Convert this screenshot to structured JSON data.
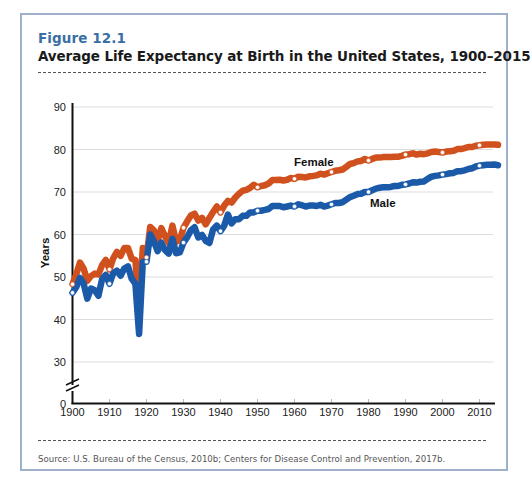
{
  "figure": {
    "number": "Figure 12.1",
    "title": "Average Life Expectancy at Birth in the United States, 1900–2015",
    "source": "Source: U.S. Bureau of the Census, 2010b; Centers for Disease Control and Prevention, 2017b."
  },
  "colors": {
    "female": "#d0501e",
    "male": "#1b5aa8",
    "frame": "#9fb0cc",
    "figure_number": "#3a6ea5",
    "grid": "#dcdcdc"
  },
  "chart_data": {
    "type": "line",
    "title": "Average Life Expectancy at Birth in the United States, 1900–2015",
    "xlabel": "",
    "ylabel": "Years",
    "xlim": [
      1900,
      2015
    ],
    "ylim": [
      0,
      90
    ],
    "y_axis_break": [
      0,
      30
    ],
    "x_ticks": [
      1900,
      1910,
      1920,
      1930,
      1940,
      1950,
      1960,
      1970,
      1980,
      1990,
      2000,
      2010
    ],
    "y_ticks": [
      0,
      30,
      40,
      50,
      60,
      70,
      80,
      90
    ],
    "grid": true,
    "legend_position": "inline labels",
    "x": [
      1900,
      1901,
      1902,
      1903,
      1904,
      1905,
      1906,
      1907,
      1908,
      1909,
      1910,
      1911,
      1912,
      1913,
      1914,
      1915,
      1916,
      1917,
      1918,
      1919,
      1920,
      1921,
      1922,
      1923,
      1924,
      1925,
      1926,
      1927,
      1928,
      1929,
      1930,
      1931,
      1932,
      1933,
      1934,
      1935,
      1936,
      1937,
      1938,
      1939,
      1940,
      1941,
      1942,
      1943,
      1944,
      1945,
      1946,
      1947,
      1948,
      1949,
      1950,
      1951,
      1952,
      1953,
      1954,
      1955,
      1956,
      1957,
      1958,
      1959,
      1960,
      1961,
      1962,
      1963,
      1964,
      1965,
      1966,
      1967,
      1968,
      1969,
      1970,
      1971,
      1972,
      1973,
      1974,
      1975,
      1976,
      1977,
      1978,
      1979,
      1980,
      1981,
      1982,
      1983,
      1984,
      1985,
      1986,
      1987,
      1988,
      1989,
      1990,
      1991,
      1992,
      1993,
      1994,
      1995,
      1996,
      1997,
      1998,
      1999,
      2000,
      2001,
      2002,
      2003,
      2004,
      2005,
      2006,
      2007,
      2008,
      2009,
      2010,
      2011,
      2012,
      2013,
      2014,
      2015
    ],
    "series": [
      {
        "name": "Female",
        "label_position": [
          1960,
          78
        ],
        "values": [
          48.3,
          50.6,
          53.4,
          52.0,
          49.1,
          50.2,
          50.8,
          50.6,
          52.8,
          54.0,
          51.8,
          54.4,
          55.9,
          55.0,
          56.8,
          56.8,
          54.3,
          54.0,
          42.2,
          56.8,
          54.6,
          61.8,
          61.0,
          58.5,
          61.5,
          59.6,
          58.0,
          62.1,
          58.3,
          58.7,
          61.6,
          63.1,
          64.5,
          64.9,
          63.3,
          63.9,
          62.4,
          63.9,
          65.3,
          66.6,
          65.2,
          66.8,
          67.9,
          67.5,
          68.7,
          69.6,
          70.3,
          70.5,
          71.0,
          71.7,
          71.1,
          71.4,
          71.6,
          72.0,
          72.8,
          72.8,
          72.9,
          72.7,
          72.9,
          73.3,
          73.1,
          73.6,
          73.5,
          73.4,
          73.7,
          73.8,
          73.9,
          74.3,
          74.1,
          74.4,
          74.7,
          75.0,
          75.1,
          75.3,
          75.9,
          76.6,
          76.8,
          77.2,
          77.3,
          77.8,
          77.4,
          77.8,
          78.1,
          78.1,
          78.2,
          78.2,
          78.2,
          78.3,
          78.3,
          78.5,
          78.8,
          78.9,
          79.1,
          78.8,
          79.0,
          78.9,
          79.1,
          79.4,
          79.5,
          79.4,
          79.3,
          79.5,
          79.6,
          79.7,
          80.1,
          80.1,
          80.3,
          80.6,
          80.6,
          80.9,
          81.0,
          81.1,
          81.2,
          81.2,
          81.2,
          81.1
        ]
      },
      {
        "name": "Male",
        "label_position": [
          1985,
          71
        ],
        "values": [
          46.3,
          47.6,
          49.8,
          48.5,
          44.9,
          47.3,
          46.9,
          45.6,
          49.5,
          50.5,
          48.4,
          50.9,
          51.5,
          50.3,
          52.0,
          52.5,
          49.6,
          48.4,
          36.6,
          53.5,
          53.6,
          60.0,
          58.4,
          56.1,
          58.1,
          56.3,
          55.5,
          59.0,
          55.6,
          55.8,
          58.1,
          59.4,
          61.0,
          61.7,
          59.3,
          59.9,
          58.5,
          58.0,
          61.2,
          62.1,
          60.8,
          62.1,
          64.7,
          62.6,
          63.6,
          63.6,
          64.4,
          64.4,
          65.2,
          65.2,
          65.6,
          65.6,
          65.8,
          66.0,
          66.7,
          66.7,
          66.7,
          66.4,
          66.6,
          66.8,
          66.6,
          67.1,
          66.9,
          66.6,
          66.8,
          66.8,
          66.7,
          67.0,
          66.6,
          66.8,
          67.1,
          67.4,
          67.4,
          67.6,
          68.2,
          68.8,
          69.1,
          69.5,
          69.6,
          70.0,
          70.0,
          70.4,
          70.8,
          71.0,
          71.1,
          71.1,
          71.2,
          71.4,
          71.4,
          71.7,
          71.8,
          72.0,
          72.3,
          72.2,
          72.4,
          72.5,
          73.1,
          73.6,
          73.8,
          73.9,
          74.1,
          74.2,
          74.4,
          74.5,
          74.9,
          74.9,
          75.1,
          75.4,
          75.6,
          76.0,
          76.2,
          76.3,
          76.4,
          76.4,
          76.5,
          76.3
        ]
      }
    ],
    "annotations": [
      "Female",
      "Male"
    ]
  },
  "axis": {
    "y_label": "Years",
    "y_ticks": [
      "90",
      "80",
      "70",
      "60",
      "50",
      "40",
      "30",
      "0"
    ],
    "x_ticks": [
      "1900",
      "1910",
      "1920",
      "1930",
      "1940",
      "1950",
      "1960",
      "1970",
      "1980",
      "1990",
      "2000",
      "2010"
    ]
  },
  "labels": {
    "female": "Female",
    "male": "Male"
  }
}
